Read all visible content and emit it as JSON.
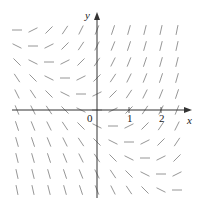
{
  "chart_data": {
    "type": "direction_field",
    "title": "",
    "equation": "dy/dx = x + y",
    "xlabel": "x",
    "ylabel": "y",
    "x_ticks": [
      {
        "value": 0,
        "label": "0"
      },
      {
        "value": 1,
        "label": "1"
      },
      {
        "value": 2,
        "label": "2"
      }
    ],
    "grid_step": 0.5,
    "x_range": [
      -2.5,
      2.5
    ],
    "y_range": [
      -2.5,
      2.5
    ],
    "grid": false,
    "x_values": [
      -2.5,
      -2,
      -1.5,
      -1,
      -0.5,
      0,
      0.5,
      1,
      1.5,
      2,
      2.5
    ],
    "y_values": [
      2.5,
      2,
      1.5,
      1,
      0.5,
      0,
      -0.5,
      -1,
      -1.5,
      -2,
      -2.5
    ],
    "slopes_by_row": [
      [
        0,
        0.5,
        1,
        1.5,
        2,
        2.5,
        3,
        3.5,
        4,
        4.5,
        5
      ],
      [
        -0.5,
        0,
        0.5,
        1,
        1.5,
        2,
        2.5,
        3,
        3.5,
        4,
        4.5
      ],
      [
        -1,
        -0.5,
        0,
        0.5,
        1,
        1.5,
        2,
        2.5,
        3,
        3.5,
        4
      ],
      [
        -1.5,
        -1,
        -0.5,
        0,
        0.5,
        1,
        1.5,
        2,
        2.5,
        3,
        3.5
      ],
      [
        -2,
        -1.5,
        -1,
        -0.5,
        0,
        0.5,
        1,
        1.5,
        2,
        2.5,
        3
      ],
      [
        -2.5,
        -2,
        -1.5,
        -1,
        -0.5,
        0,
        0.5,
        1,
        1.5,
        2,
        2.5
      ],
      [
        -3,
        -2.5,
        -2,
        -1.5,
        -1,
        -0.5,
        0,
        0.5,
        1,
        1.5,
        2
      ],
      [
        -3.5,
        -3,
        -2.5,
        -2,
        -1.5,
        -1,
        -0.5,
        0,
        0.5,
        1,
        1.5
      ],
      [
        -4,
        -3.5,
        -3,
        -2.5,
        -2,
        -1.5,
        -1,
        -0.5,
        0,
        0.5,
        1
      ],
      [
        -4.5,
        -4,
        -3.5,
        -3,
        -2.5,
        -2,
        -1.5,
        -1,
        -0.5,
        0,
        0.5
      ],
      [
        -5,
        -4.5,
        -4,
        -3.5,
        -3,
        -2.5,
        -2,
        -1.5,
        -1,
        -0.5,
        0
      ]
    ]
  },
  "style": {
    "segment_color": "#8a8a8a",
    "axis_color": "#333333"
  },
  "labels": {
    "x_axis": "x",
    "y_axis": "y",
    "origin": "0",
    "tick_1": "1",
    "tick_2": "2"
  }
}
